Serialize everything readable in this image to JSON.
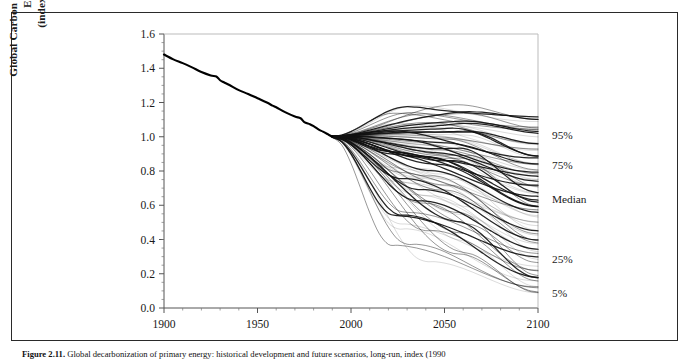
{
  "figure": {
    "caption_label": "Figure 2.11.",
    "caption_text": "Global decarbonization of primary energy: historical development and future scenarios, long-run, index (1990"
  },
  "chart_data": {
    "type": "line",
    "title": "",
    "xlabel": "",
    "ylabel": "Global Carbon Dioxide Intensity of Energy (index, 1990=1)",
    "ylabel_line1": "Global Carbon Dioxide Intensity of Energy",
    "ylabel_line2": "(index, 1990=1)",
    "xlim": [
      1900,
      2100
    ],
    "ylim": [
      0.0,
      1.6
    ],
    "grid": false,
    "legend_position": "right-outside",
    "xticks": [
      1900,
      1950,
      2000,
      2050,
      2100
    ],
    "xtick_labels": [
      "1900",
      "1950",
      "2000",
      "2050",
      "2100"
    ],
    "xminor_step": 10,
    "yticks": [
      0.0,
      0.2,
      0.4,
      0.6,
      0.8,
      1.0,
      1.2,
      1.4,
      1.6
    ],
    "ytick_labels": [
      "0.0",
      "0.2",
      "0.4",
      "0.6",
      "0.8",
      "1.0",
      "1.2",
      "1.4",
      "1.6"
    ],
    "yminor_step": 0.05,
    "annotations": [
      {
        "label": "95%",
        "year": 2100,
        "value": 1.01
      },
      {
        "label": "75%",
        "year": 2100,
        "value": 0.835
      },
      {
        "label": "Median",
        "year": 2100,
        "value": 0.635
      },
      {
        "label": "25%",
        "year": 2100,
        "value": 0.285
      },
      {
        "label": "5%",
        "year": 2100,
        "value": 0.09
      }
    ],
    "series": [
      {
        "name": "Historical",
        "kind": "historical",
        "x": [
          1900,
          1905,
          1910,
          1915,
          1920,
          1925,
          1928,
          1930,
          1932,
          1935,
          1940,
          1945,
          1950,
          1955,
          1958,
          1960,
          1965,
          1970,
          1973,
          1975,
          1978,
          1980,
          1983,
          1985,
          1988,
          1990
        ],
        "values": [
          1.48,
          1.452,
          1.43,
          1.405,
          1.378,
          1.358,
          1.352,
          1.33,
          1.318,
          1.302,
          1.272,
          1.25,
          1.225,
          1.2,
          1.182,
          1.172,
          1.142,
          1.118,
          1.108,
          1.085,
          1.073,
          1.062,
          1.04,
          1.03,
          1.012,
          1.0
        ]
      },
      {
        "name": "Scenario bundle A (high)",
        "kind": "scenario_group",
        "count": 18,
        "endpoint_range_2100": [
          0.9,
          1.12
        ],
        "peak_2050_range": [
          1.02,
          1.2
        ]
      },
      {
        "name": "Scenario bundle B (upper-middle)",
        "kind": "scenario_group",
        "count": 20,
        "endpoint_range_2100": [
          0.7,
          0.9
        ],
        "peak_2050_range": [
          0.88,
          1.05
        ]
      },
      {
        "name": "Scenario bundle C (middle)",
        "kind": "scenario_group",
        "count": 20,
        "endpoint_range_2100": [
          0.46,
          0.7
        ],
        "peak_2050_range": [
          0.7,
          0.98
        ]
      },
      {
        "name": "Scenario bundle D (lower)",
        "kind": "scenario_group",
        "count": 16,
        "endpoint_range_2100": [
          0.22,
          0.46
        ],
        "peak_2050_range": [
          0.45,
          0.82
        ]
      },
      {
        "name": "Scenario bundle E (low)",
        "kind": "scenario_group",
        "count": 12,
        "endpoint_range_2100": [
          0.06,
          0.22
        ],
        "peak_2050_range": [
          0.25,
          0.6
        ]
      }
    ]
  }
}
